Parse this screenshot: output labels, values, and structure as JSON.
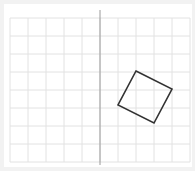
{
  "diagram": {
    "type": "grid-with-shape",
    "grid": {
      "x0": 10,
      "y0": 18,
      "cell": 18,
      "cols": 10,
      "rows": 8,
      "line_color": "#e2e2e2"
    },
    "divider": {
      "x": 100,
      "y1": 10,
      "y2": 165,
      "color": "#9a9a9a"
    },
    "shape": {
      "name": "rotated-square",
      "points": [
        [
          136,
          71
        ],
        [
          172,
          89
        ],
        [
          154,
          123
        ],
        [
          118,
          105
        ]
      ],
      "stroke": "#333333"
    }
  }
}
